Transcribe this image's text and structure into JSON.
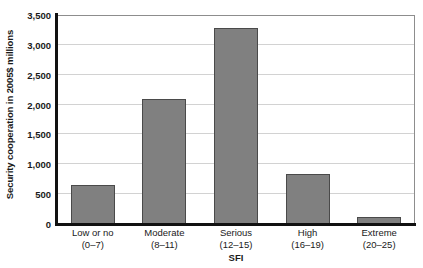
{
  "chart_data": {
    "type": "bar",
    "title": "",
    "xlabel": "SFI",
    "ylabel": "Security cooperation in 2005$ millions",
    "categories": [
      "Low or no",
      "Moderate",
      "Serious",
      "High",
      "Extreme"
    ],
    "category_ranges": [
      "(0–7)",
      "(8–11)",
      "(12–15)",
      "(16–19)",
      "(20–25)"
    ],
    "values": [
      660,
      2100,
      3280,
      830,
      110
    ],
    "ylim": [
      0,
      3500
    ],
    "ytick_values": [
      0,
      500,
      1000,
      1500,
      2000,
      2500,
      3000,
      3500
    ],
    "ytick_labels": [
      "0",
      "500",
      "1,000",
      "1,500",
      "2,000",
      "2,500",
      "3,000",
      "3,500"
    ],
    "grid": true,
    "legend": false,
    "bar_color": "#808080",
    "bar_edge_color": "#4a4a4a",
    "gridline_color": "#d2d2d2",
    "axis_color": "#111111",
    "plot_border_color": "#8d8d8d"
  }
}
